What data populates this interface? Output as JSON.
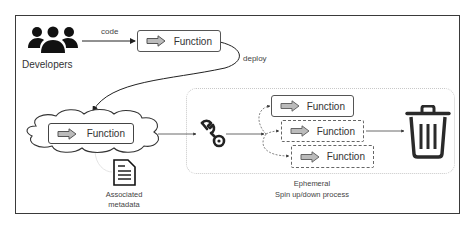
{
  "diagram": {
    "developers": {
      "label": "Developers",
      "icon": "people-group-icon"
    },
    "edges": {
      "code_label": "code",
      "deploy_label": "deploy"
    },
    "source_function": {
      "label": "Function",
      "icon": "right-arrow-icon"
    },
    "cloud_function": {
      "label": "Function",
      "icon": "right-arrow-icon",
      "container": "cloud"
    },
    "metadata": {
      "label_line1": "Associated",
      "label_line2": "metadata",
      "icon": "document-icon"
    },
    "builder": {
      "icon": "wrench-icon"
    },
    "ephemeral": {
      "instances": [
        {
          "label": "Function",
          "style": "solid"
        },
        {
          "label": "Function",
          "style": "dashed"
        },
        {
          "label": "Function",
          "style": "dashed"
        }
      ],
      "caption_line1": "Ephemeral",
      "caption_line2": "Spin up/down process"
    },
    "disposal": {
      "icon": "trash-can-icon"
    }
  }
}
